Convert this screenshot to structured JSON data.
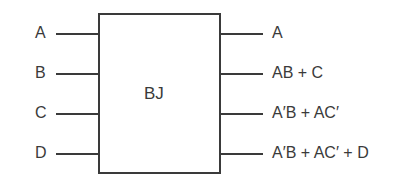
{
  "diagram": {
    "block": {
      "label": "BJ"
    },
    "inputs": [
      {
        "label": "A"
      },
      {
        "label": "B"
      },
      {
        "label": "C"
      },
      {
        "label": "D"
      }
    ],
    "outputs": [
      {
        "label": "A"
      },
      {
        "label": "AB + C"
      },
      {
        "label": "A′B + AC′"
      },
      {
        "label": "A′B + AC′ + D"
      }
    ]
  }
}
